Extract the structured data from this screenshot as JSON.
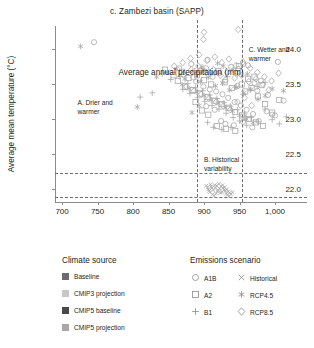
{
  "chart_data": {
    "type": "scatter",
    "title": "c. Zambezi basin (SAPP)",
    "xlabel": "Average annual precipitation (mm)",
    "ylabel": "Average mean temperature (°C)",
    "xlim": [
      690,
      1045
    ],
    "ylim": [
      21.82,
      24.32
    ],
    "xticks": [
      700,
      750,
      800,
      850,
      900,
      950,
      1000
    ],
    "xticklabels": [
      "700",
      "750",
      "800",
      "850",
      "900",
      "950",
      "1,000"
    ],
    "yticks": [
      22.0,
      22.5,
      23.0,
      23.5,
      24.0
    ],
    "yticklabels": [
      "22.0",
      "22.5",
      "23.0",
      "23.5",
      "24.0"
    ],
    "grid": false,
    "legend_position": "below",
    "marker_color": "#a7a5a6",
    "reference_lines": {
      "vertical": [
        890,
        953
      ],
      "horizontal": [
        22.235,
        21.885
      ],
      "style": "dashed",
      "color": "#6f6d6e"
    },
    "annotations": [
      {
        "id": "A",
        "text": "A. Drier and warmer",
        "x": 757,
        "y": 23.28
      },
      {
        "id": "B",
        "text": "B. Historical variability",
        "x": 900,
        "y": 22.47
      },
      {
        "id": "C",
        "text": "C. Wetter and warmer",
        "x": 963,
        "y": 24.03
      }
    ],
    "series": [
      {
        "name": "Historical",
        "marker": "x",
        "points": [
          [
            906,
            22.0
          ],
          [
            910,
            22.04
          ],
          [
            913,
            21.99
          ],
          [
            916,
            22.02
          ],
          [
            919,
            21.97
          ],
          [
            922,
            22.01
          ],
          [
            925,
            21.96
          ],
          [
            928,
            21.99
          ],
          [
            931,
            21.94
          ],
          [
            934,
            21.97
          ],
          [
            908,
            21.96
          ],
          [
            912,
            21.93
          ],
          [
            915,
            22.06
          ],
          [
            918,
            22.05
          ],
          [
            921,
            22.08
          ],
          [
            924,
            22.04
          ],
          [
            927,
            22.02
          ],
          [
            930,
            21.98
          ],
          [
            933,
            21.92
          ],
          [
            936,
            21.95
          ],
          [
            905,
            22.03
          ],
          [
            909,
            22.07
          ],
          [
            914,
            21.91
          ],
          [
            917,
            21.94
          ],
          [
            920,
            21.99
          ],
          [
            923,
            21.95
          ],
          [
            926,
            22.06
          ],
          [
            929,
            22.03
          ],
          [
            932,
            22.0
          ],
          [
            935,
            21.9
          ],
          [
            911,
            22.02
          ],
          [
            907,
            21.98
          ],
          [
            938,
            21.93
          ],
          [
            940,
            21.96
          ],
          [
            903,
            22.05
          ]
        ]
      },
      {
        "name": "A1B",
        "marker": "circle",
        "points": [
          [
            745,
            24.09
          ],
          [
            865,
            23.72
          ],
          [
            882,
            23.78
          ],
          [
            893,
            23.66
          ],
          [
            903,
            23.72
          ],
          [
            912,
            23.6
          ],
          [
            921,
            23.65
          ],
          [
            930,
            23.55
          ],
          [
            938,
            23.74
          ],
          [
            947,
            23.47
          ],
          [
            955,
            23.78
          ],
          [
            962,
            23.76
          ],
          [
            971,
            23.51
          ],
          [
            980,
            23.54
          ],
          [
            988,
            23.11
          ],
          [
            996,
            23.06
          ],
          [
            1004,
            23.81
          ],
          [
            1012,
            23.26
          ],
          [
            871,
            23.63
          ],
          [
            889,
            23.53
          ],
          [
            899,
            23.46
          ],
          [
            908,
            23.42
          ],
          [
            917,
            23.39
          ],
          [
            926,
            23.35
          ],
          [
            934,
            23.3
          ],
          [
            943,
            23.24
          ],
          [
            952,
            23.19
          ],
          [
            960,
            23.13
          ],
          [
            969,
            23.07
          ],
          [
            977,
            22.97
          ],
          [
            930,
            22.93
          ],
          [
            942,
            22.91
          ],
          [
            955,
            22.96
          ],
          [
            968,
            22.88
          ],
          [
            903,
            23.18
          ],
          [
            915,
            23.13
          ],
          [
            885,
            23.59
          ],
          [
            895,
            23.69
          ],
          [
            905,
            23.84
          ],
          [
            948,
            23.71
          ],
          [
            975,
            23.4
          ],
          [
            990,
            23.34
          ],
          [
            1000,
            23.05
          ],
          [
            958,
            23.01
          ],
          [
            924,
            22.97
          ]
        ]
      },
      {
        "name": "A2",
        "marker": "square",
        "points": [
          [
            845,
            23.7
          ],
          [
            857,
            23.62
          ],
          [
            869,
            23.67
          ],
          [
            878,
            23.58
          ],
          [
            890,
            23.62
          ],
          [
            900,
            23.55
          ],
          [
            910,
            23.49
          ],
          [
            920,
            23.68
          ],
          [
            929,
            23.52
          ],
          [
            939,
            23.44
          ],
          [
            949,
            23.75
          ],
          [
            958,
            23.39
          ],
          [
            967,
            23.44
          ],
          [
            976,
            23.32
          ],
          [
            986,
            23.21
          ],
          [
            996,
            23.09
          ],
          [
            1006,
            23.27
          ],
          [
            863,
            23.54
          ],
          [
            873,
            23.46
          ],
          [
            884,
            23.41
          ],
          [
            894,
            23.36
          ],
          [
            905,
            23.31
          ],
          [
            915,
            23.26
          ],
          [
            925,
            23.21
          ],
          [
            935,
            23.16
          ],
          [
            944,
            23.1
          ],
          [
            954,
            23.05
          ],
          [
            963,
            23.0
          ],
          [
            973,
            22.95
          ],
          [
            983,
            22.9
          ],
          [
            918,
            22.9
          ],
          [
            931,
            22.86
          ],
          [
            944,
            22.83
          ],
          [
            906,
            23.06
          ],
          [
            897,
            23.12
          ],
          [
            888,
            23.24
          ],
          [
            953,
            23.49
          ],
          [
            962,
            23.57
          ],
          [
            971,
            23.6
          ],
          [
            981,
            23.48
          ]
        ]
      },
      {
        "name": "B1",
        "marker": "plus",
        "points": [
          [
            810,
            23.31
          ],
          [
            827,
            23.37
          ],
          [
            841,
            23.64
          ],
          [
            853,
            23.56
          ],
          [
            866,
            23.6
          ],
          [
            877,
            23.5
          ],
          [
            888,
            23.44
          ],
          [
            898,
            23.4
          ],
          [
            908,
            23.34
          ],
          [
            918,
            23.29
          ],
          [
            928,
            23.23
          ],
          [
            937,
            23.18
          ],
          [
            947,
            23.13
          ],
          [
            957,
            23.07
          ],
          [
            966,
            23.02
          ],
          [
            976,
            22.96
          ],
          [
            986,
            23.14
          ],
          [
            996,
            22.99
          ],
          [
            1006,
            22.93
          ],
          [
            1016,
            23.03
          ],
          [
            870,
            23.42
          ],
          [
            880,
            23.36
          ],
          [
            891,
            23.3
          ],
          [
            901,
            23.25
          ],
          [
            911,
            23.19
          ],
          [
            921,
            23.14
          ],
          [
            931,
            23.08
          ],
          [
            941,
            23.02
          ],
          [
            950,
            22.97
          ],
          [
            960,
            22.91
          ],
          [
            913,
            22.88
          ],
          [
            925,
            22.85
          ],
          [
            938,
            22.88
          ],
          [
            905,
            22.95
          ],
          [
            955,
            23.35
          ],
          [
            965,
            23.41
          ],
          [
            975,
            23.46
          ],
          [
            986,
            23.52
          ],
          [
            944,
            23.45
          ],
          [
            933,
            23.6
          ]
        ]
      },
      {
        "name": "RCP4.5",
        "marker": "asterisk",
        "points": [
          [
            726,
            24.03
          ],
          [
            806,
            23.17
          ],
          [
            833,
            23.6
          ],
          [
            848,
            23.66
          ],
          [
            861,
            23.71
          ],
          [
            873,
            23.57
          ],
          [
            884,
            23.67
          ],
          [
            895,
            23.53
          ],
          [
            906,
            23.59
          ],
          [
            916,
            23.47
          ],
          [
            926,
            23.51
          ],
          [
            936,
            23.41
          ],
          [
            946,
            23.45
          ],
          [
            956,
            23.37
          ],
          [
            966,
            23.42
          ],
          [
            976,
            23.28
          ],
          [
            986,
            23.33
          ],
          [
            996,
            23.43
          ],
          [
            1012,
            23.4
          ],
          [
            869,
            23.49
          ],
          [
            879,
            23.43
          ],
          [
            890,
            23.38
          ],
          [
            900,
            23.33
          ],
          [
            910,
            23.27
          ],
          [
            920,
            23.22
          ],
          [
            930,
            23.16
          ],
          [
            940,
            23.11
          ],
          [
            950,
            23.05
          ],
          [
            959,
            23.0
          ],
          [
            969,
            22.95
          ],
          [
            897,
            23.74
          ],
          [
            919,
            23.79
          ],
          [
            941,
            23.7
          ],
          [
            961,
            23.64
          ],
          [
            911,
            23.64
          ],
          [
            901,
            23.69
          ],
          [
            927,
            23.75
          ],
          [
            893,
            23.19
          ],
          [
            883,
            23.09
          ],
          [
            947,
            23.63
          ]
        ]
      },
      {
        "name": "RCP8.5",
        "marker": "diamond",
        "points": [
          [
            900,
            24.23
          ],
          [
            948,
            24.27
          ],
          [
            899,
            24.13
          ],
          [
            881,
            23.86
          ],
          [
            893,
            23.91
          ],
          [
            904,
            23.83
          ],
          [
            915,
            23.88
          ],
          [
            925,
            23.8
          ],
          [
            935,
            23.85
          ],
          [
            945,
            23.76
          ],
          [
            955,
            23.81
          ],
          [
            965,
            23.72
          ],
          [
            975,
            23.66
          ],
          [
            985,
            23.6
          ],
          [
            995,
            23.54
          ],
          [
            1005,
            23.65
          ],
          [
            858,
            23.75
          ],
          [
            870,
            23.8
          ],
          [
            882,
            23.7
          ],
          [
            892,
            23.75
          ],
          [
            903,
            23.66
          ],
          [
            913,
            23.7
          ],
          [
            923,
            23.62
          ],
          [
            933,
            23.66
          ],
          [
            943,
            23.58
          ],
          [
            953,
            23.62
          ],
          [
            963,
            23.53
          ],
          [
            973,
            23.57
          ],
          [
            983,
            23.49
          ],
          [
            875,
            23.46
          ],
          [
            886,
            23.4
          ],
          [
            896,
            23.35
          ],
          [
            907,
            23.29
          ],
          [
            917,
            23.24
          ],
          [
            927,
            23.18
          ],
          [
            937,
            23.13
          ],
          [
            947,
            23.24
          ],
          [
            957,
            23.3
          ],
          [
            967,
            23.19
          ],
          [
            991,
            23.41
          ]
        ]
      }
    ]
  },
  "legend": {
    "climate_source": {
      "heading": "Climate source",
      "items": [
        {
          "label": "Baseline",
          "color": "#6d6b6c"
        },
        {
          "label": "CMIP3 projection",
          "color": "#c9c7c8"
        },
        {
          "label": "CMIP5 baseline",
          "color": "#4a4849"
        },
        {
          "label": "CMIP5 projection",
          "color": "#a9a7a8"
        }
      ]
    },
    "emissions_scenario": {
      "heading": "Emissions scenario",
      "items": [
        {
          "label": "A1B",
          "marker": "circle"
        },
        {
          "label": "Historical",
          "marker": "x"
        },
        {
          "label": "A2",
          "marker": "square"
        },
        {
          "label": "RCP4.5",
          "marker": "asterisk"
        },
        {
          "label": "B1",
          "marker": "plus"
        },
        {
          "label": "RCP8.5",
          "marker": "diamond"
        }
      ]
    }
  }
}
